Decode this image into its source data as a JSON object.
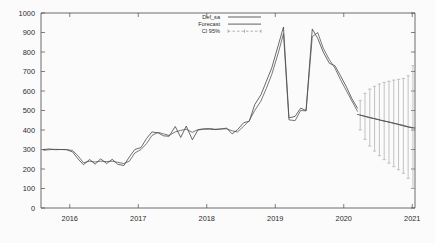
{
  "chart_data": {
    "type": "line",
    "title": "",
    "xlabel": "",
    "ylabel": "",
    "xlim": [
      2015.58,
      2021.04
    ],
    "ylim": [
      0,
      1000
    ],
    "grid": false,
    "legend_position": "top-center-right",
    "y_ticks": [
      "0",
      "100",
      "200",
      "300",
      "400",
      "500",
      "600",
      "700",
      "800",
      "900",
      "1000"
    ],
    "y_tick_values": [
      0,
      100,
      200,
      300,
      400,
      500,
      600,
      700,
      800,
      900,
      1000
    ],
    "x_ticks": [
      "2016",
      "2017",
      "2018",
      "2019",
      "2020",
      "2021"
    ],
    "x_tick_values": [
      2016,
      2017,
      2018,
      2019,
      2020,
      2021
    ],
    "legend": [
      {
        "label": "Def_sa",
        "style": "solid-line",
        "color": "#3a3a3a"
      },
      {
        "label": "Forecast",
        "style": "solid-line",
        "color": "#4d4d4d"
      },
      {
        "label": "CI 95%",
        "style": "errorbar",
        "color": "#8f8f8f"
      }
    ],
    "series": [
      {
        "name": "Def_sa",
        "style": "solid",
        "x": [
          2015.62,
          2015.7,
          2015.79,
          2015.87,
          2015.95,
          2016.04,
          2016.12,
          2016.2,
          2016.29,
          2016.37,
          2016.45,
          2016.54,
          2016.62,
          2016.7,
          2016.79,
          2016.87,
          2016.95,
          2017.04,
          2017.12,
          2017.2,
          2017.29,
          2017.37,
          2017.45,
          2017.54,
          2017.62,
          2017.7,
          2017.79,
          2017.87,
          2017.95,
          2018.04,
          2018.12,
          2018.2,
          2018.29,
          2018.37,
          2018.45,
          2018.54,
          2018.62,
          2018.7,
          2018.79,
          2018.87,
          2018.95,
          2019.04,
          2019.12,
          2019.2,
          2019.29,
          2019.37,
          2019.45,
          2019.54,
          2019.62,
          2019.7,
          2019.79,
          2019.87,
          2019.95,
          2020.04,
          2020.12,
          2020.2
        ],
        "y": [
          300,
          303,
          299,
          300,
          299,
          288,
          252,
          222,
          249,
          225,
          252,
          228,
          250,
          224,
          218,
          262,
          300,
          310,
          356,
          390,
          385,
          370,
          368,
          418,
          362,
          420,
          350,
          400,
          404,
          404,
          402,
          404,
          410,
          380,
          402,
          438,
          444,
          530,
          580,
          650,
          720,
          830,
          928,
          462,
          470,
          512,
          500,
          918,
          870,
          800,
          742,
          730,
          680,
          620,
          560,
          512
        ]
      },
      {
        "name": "Forecast-fit",
        "style": "solid",
        "x": [
          2015.62,
          2015.7,
          2015.79,
          2015.87,
          2015.95,
          2016.04,
          2016.12,
          2016.2,
          2016.29,
          2016.37,
          2016.45,
          2016.54,
          2016.62,
          2016.7,
          2016.79,
          2016.87,
          2016.95,
          2017.04,
          2017.12,
          2017.2,
          2017.29,
          2017.37,
          2017.45,
          2017.54,
          2017.62,
          2017.7,
          2017.79,
          2017.87,
          2017.95,
          2018.04,
          2018.12,
          2018.2,
          2018.29,
          2018.37,
          2018.45,
          2018.54,
          2018.62,
          2018.7,
          2018.79,
          2018.87,
          2018.95,
          2019.04,
          2019.12,
          2019.2,
          2019.29,
          2019.37,
          2019.45,
          2019.54,
          2019.62,
          2019.7,
          2019.79,
          2019.87,
          2019.95,
          2020.04,
          2020.12,
          2020.2
        ],
        "y": [
          296,
          299,
          301,
          300,
          300,
          295,
          268,
          232,
          240,
          236,
          240,
          238,
          240,
          234,
          228,
          240,
          282,
          300,
          330,
          372,
          388,
          380,
          372,
          390,
          398,
          404,
          388,
          402,
          406,
          408,
          404,
          406,
          406,
          396,
          390,
          420,
          448,
          500,
          548,
          614,
          686,
          790,
          894,
          452,
          448,
          500,
          498,
          878,
          900,
          820,
          760,
          718,
          660,
          600,
          548,
          496
        ]
      },
      {
        "name": "Forecast",
        "style": "solid",
        "x": [
          2020.2,
          2020.29,
          2020.37,
          2020.45,
          2020.54,
          2020.62,
          2020.7,
          2020.79,
          2020.87,
          2020.95,
          2021.04
        ],
        "y": [
          480,
          472,
          464,
          458,
          450,
          444,
          438,
          430,
          424,
          416,
          410
        ]
      }
    ],
    "confidence_interval": {
      "name": "CI 95%",
      "level": "95%",
      "x": [
        2020.24,
        2020.31,
        2020.38,
        2020.45,
        2020.52,
        2020.59,
        2020.66,
        2020.73,
        2020.8,
        2020.87,
        2020.94,
        2021.01
      ],
      "center": [
        476,
        470,
        464,
        458,
        452,
        446,
        440,
        434,
        428,
        421,
        415,
        410
      ],
      "lower": [
        400,
        352,
        318,
        292,
        268,
        248,
        230,
        212,
        196,
        178,
        152,
        100
      ],
      "upper": [
        552,
        588,
        610,
        624,
        636,
        644,
        650,
        656,
        660,
        664,
        678,
        730
      ]
    }
  }
}
